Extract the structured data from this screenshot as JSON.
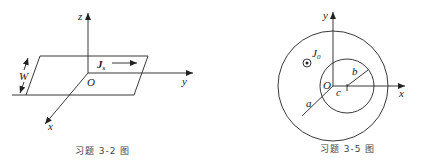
{
  "figures": [
    {
      "caption": "习题 3-2 图",
      "labels": {
        "z": "z",
        "y": "y",
        "x": "x",
        "origin": "O",
        "width": "W",
        "current": "J",
        "current_sub": "s"
      }
    },
    {
      "caption": "习题 3-5 图",
      "labels": {
        "y": "y",
        "x": "x",
        "origin": "O",
        "current": "J",
        "current_sub": "0",
        "outer_radius": "a",
        "inner_radius": "b",
        "offset": "c"
      }
    }
  ],
  "colors": {
    "line": "#222222",
    "caption": "#444444",
    "background": "#ffffff"
  }
}
